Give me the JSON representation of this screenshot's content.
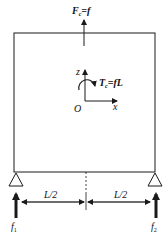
{
  "diagram": {
    "labels": {
      "top_force": {
        "main": "F",
        "sub": "c",
        "rest": "=f"
      },
      "torque": {
        "main": "T",
        "sub": "c",
        "rest": "=fL"
      },
      "axis_z": "z",
      "axis_x": "x",
      "origin": "O",
      "dim_left": "L/2",
      "dim_right": "L/2",
      "reaction_left": {
        "main": "f",
        "sub": "1"
      },
      "reaction_right": {
        "main": "f",
        "sub": "2"
      }
    },
    "colors": {
      "stroke": "#1a1a1a",
      "background": "#ffffff"
    }
  }
}
